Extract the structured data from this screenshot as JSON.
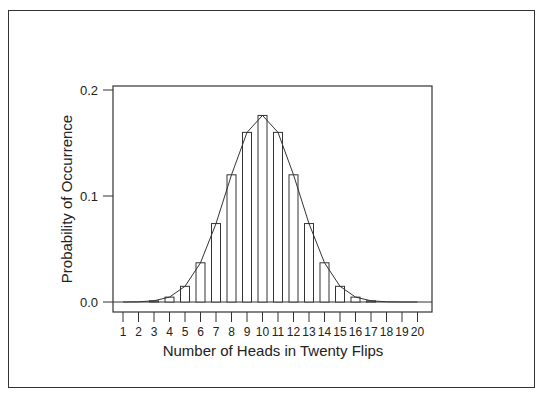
{
  "chart_data": {
    "type": "bar",
    "title": "",
    "xlabel": "Number of Heads in Twenty Flips",
    "ylabel": "Probability of Occurrence",
    "ylim": [
      0,
      0.2
    ],
    "yticks": [
      "0.0",
      "0.1",
      "0.2"
    ],
    "grid": false,
    "legend": null,
    "overlay": "line connecting bar tops (binomial curve)",
    "categories": [
      "1",
      "2",
      "3",
      "4",
      "5",
      "6",
      "7",
      "8",
      "9",
      "10",
      "11",
      "12",
      "13",
      "14",
      "15",
      "16",
      "17",
      "18",
      "19",
      "20"
    ],
    "values": [
      2e-05,
      0.0002,
      0.0011,
      0.0046,
      0.0148,
      0.037,
      0.074,
      0.12,
      0.16,
      0.176,
      0.16,
      0.12,
      0.074,
      0.037,
      0.0148,
      0.0046,
      0.0011,
      0.0002,
      2e-05,
      1e-06
    ]
  }
}
